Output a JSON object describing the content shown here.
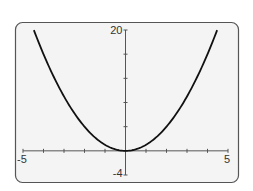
{
  "chart_data": {
    "type": "line",
    "title": "",
    "xlabel": "",
    "ylabel": "",
    "function": "y = x^2",
    "xlim": [
      -5,
      5
    ],
    "ylim": [
      -4,
      20
    ],
    "x_tick_step": 1,
    "y_tick_step": 4,
    "grid": false,
    "legend": null,
    "tick_labels": {
      "x_min": "-5",
      "x_max": "5",
      "y_max": "20",
      "y_min": "-4"
    },
    "series": [
      {
        "name": "y = x^2",
        "x": [
          -4.47,
          -4,
          -3,
          -2,
          -1,
          0,
          1,
          2,
          3,
          4,
          4.47
        ],
        "y": [
          20,
          16,
          9,
          4,
          1,
          0,
          1,
          4,
          9,
          16,
          20
        ]
      }
    ]
  },
  "colors": {
    "frame": "#555555",
    "frame_fill": "#f4f4f4",
    "axis": "#555555",
    "curve": "#111111",
    "text": "#333333"
  }
}
